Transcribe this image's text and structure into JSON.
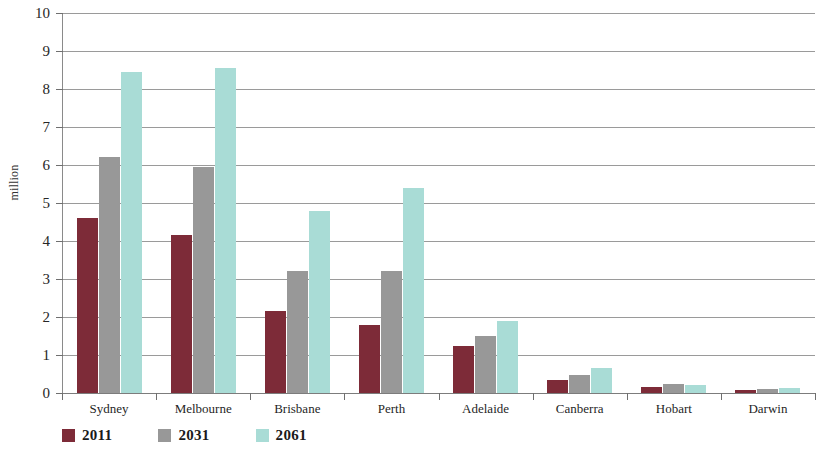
{
  "chart_data": {
    "type": "bar",
    "title": "",
    "xlabel": "",
    "ylabel": "million",
    "ylim": [
      0,
      10
    ],
    "yticks": [
      0,
      1,
      2,
      3,
      4,
      5,
      6,
      7,
      8,
      9,
      10
    ],
    "grid": true,
    "legend_position": "bottom-left",
    "categories": [
      "Sydney",
      "Melbourne",
      "Brisbane",
      "Perth",
      "Adelaide",
      "Canberra",
      "Hobart",
      "Darwin"
    ],
    "series": [
      {
        "name": "2011",
        "color": "#7d2b38",
        "values": [
          4.6,
          4.15,
          2.15,
          1.8,
          1.25,
          0.35,
          0.17,
          0.07
        ]
      },
      {
        "name": "2031",
        "color": "#989898",
        "values": [
          6.2,
          5.95,
          3.2,
          3.2,
          1.5,
          0.48,
          0.25,
          0.1
        ]
      },
      {
        "name": "2061",
        "color": "#a9dcd6",
        "values": [
          8.45,
          8.55,
          4.8,
          5.4,
          1.9,
          0.67,
          0.2,
          0.13
        ]
      }
    ]
  },
  "axis": {
    "y_title": "million"
  },
  "legend": {
    "items": [
      {
        "label": "2011",
        "color": "#7d2b38"
      },
      {
        "label": "2031",
        "color": "#989898"
      },
      {
        "label": "2061",
        "color": "#a9dcd6"
      }
    ]
  }
}
